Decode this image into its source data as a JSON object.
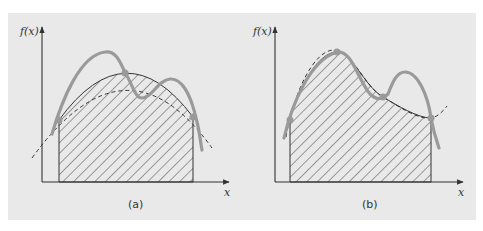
{
  "figure": {
    "background_color": "#e9e9e9",
    "axis_color": "#333333",
    "hatch_color": "#555555",
    "curve_color": "#999999",
    "dashed_color": "#333333",
    "point_color": "#9a9a9a"
  },
  "panels": [
    {
      "id": "a",
      "caption": "(a)",
      "y_axis_label": "f(x)",
      "x_axis_label": "x",
      "description": "Integral approximation using a parabola (dashed) through 3 points of the function f(x) (solid gray curve); shaded area under the parabola",
      "points": [
        {
          "label": "left",
          "x": 59,
          "y": 120
        },
        {
          "label": "middle",
          "x": 125,
          "y": 73
        },
        {
          "label": "right",
          "x": 193,
          "y": 117
        }
      ]
    },
    {
      "id": "b",
      "caption": "(b)",
      "y_axis_label": "f(x)",
      "x_axis_label": "x",
      "description": "Integral approximation using a cubic (dashed) through 4 points of the function f(x) (solid gray curve); shaded area under the cubic",
      "points": [
        {
          "label": "p0",
          "x": 290,
          "y": 120
        },
        {
          "label": "p1",
          "x": 337,
          "y": 52
        },
        {
          "label": "p2",
          "x": 383,
          "y": 97
        },
        {
          "label": "p3",
          "x": 431,
          "y": 118
        }
      ]
    }
  ]
}
